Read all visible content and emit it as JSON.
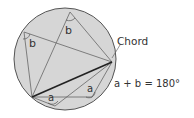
{
  "diagram": {
    "labels": {
      "chord": "Chord",
      "equation": "a + b = 180°",
      "angle_b_top": "b",
      "angle_b_left": "b",
      "angle_a_bottom": "a",
      "angle_a_right": "a"
    },
    "colors": {
      "circle_fill": "#d6d6d6",
      "stroke": "#555555",
      "chord": "#222222",
      "text": "#333333"
    }
  }
}
